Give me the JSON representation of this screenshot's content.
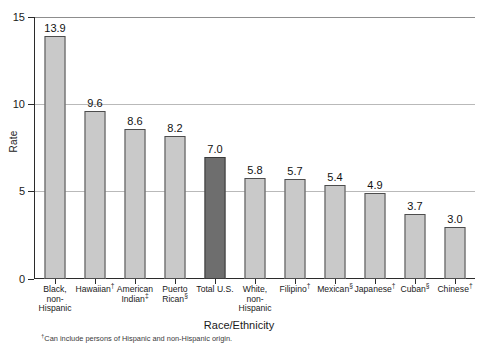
{
  "chart_data": {
    "type": "bar",
    "title": "",
    "xlabel": "Race/Ethnicity",
    "ylabel": "Rate",
    "ylim": [
      0,
      15
    ],
    "yticks": [
      0,
      5,
      10,
      15
    ],
    "ytick_labels": [
      "0",
      "5",
      "10",
      "15"
    ],
    "grid": true,
    "legend": "none",
    "categories": [
      "Black, non-Hispanic",
      "Hawaiian†",
      "American Indian‡",
      "Puerto Rican§",
      "Total U.S.",
      "White, non-Hispanic",
      "Filipino†",
      "Mexican§",
      "Japanese†",
      "Cuban§",
      "Chinese†"
    ],
    "values": [
      13.9,
      9.6,
      8.6,
      8.2,
      7.0,
      5.8,
      5.7,
      5.4,
      4.9,
      3.7,
      3.0
    ],
    "value_labels": [
      "13.9",
      "9.6",
      "8.6",
      "8.2",
      "7.0",
      "5.8",
      "5.7",
      "5.4",
      "4.9",
      "3.7",
      "3.0"
    ],
    "highlight_index": 4,
    "bar_color": "#c9c9c9",
    "highlight_color": "#6e6e6e",
    "bar_border_color": "#4d4d4d",
    "gridline_color": "#b9b9b9",
    "axis_color": "#2b2b2b"
  },
  "axis": {
    "y_title": "Rate",
    "x_title": "Race/Ethnicity",
    "y_tick_0": "0",
    "y_tick_1": "5",
    "y_tick_2": "10",
    "y_tick_3": "15"
  },
  "category_labels": [
    {
      "lines": [
        "Black,",
        "non-",
        "Hispanic"
      ],
      "marker": ""
    },
    {
      "lines": [
        "Hawaiian"
      ],
      "marker": "†"
    },
    {
      "lines": [
        "American",
        "Indian"
      ],
      "marker": "‡"
    },
    {
      "lines": [
        "Puerto",
        "Rican"
      ],
      "marker": "§"
    },
    {
      "lines": [
        "Total U.S."
      ],
      "marker": ""
    },
    {
      "lines": [
        "White,",
        "non-",
        "Hispanic"
      ],
      "marker": ""
    },
    {
      "lines": [
        "Filipino"
      ],
      "marker": "†"
    },
    {
      "lines": [
        "Mexican"
      ],
      "marker": "§"
    },
    {
      "lines": [
        "Japanese"
      ],
      "marker": "†"
    },
    {
      "lines": [
        "Cuban"
      ],
      "marker": "§"
    },
    {
      "lines": [
        "Chinese"
      ],
      "marker": "†"
    }
  ],
  "footnote": {
    "marker": "†",
    "text": "Can include persons of Hispanic and non-Hispanic origin."
  }
}
